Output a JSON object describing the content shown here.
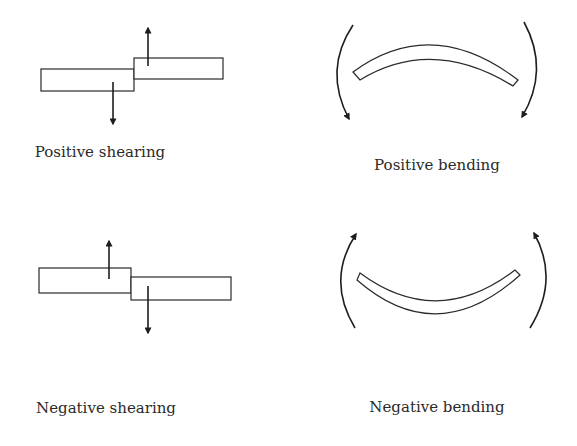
{
  "diagram": {
    "panels": [
      {
        "id": "positive-shearing",
        "label": "Positive shearing"
      },
      {
        "id": "positive-bending",
        "label": "Positive bending"
      },
      {
        "id": "negative-shearing",
        "label": "Negative shearing"
      },
      {
        "id": "negative-bending",
        "label": "Negative bending"
      }
    ]
  }
}
